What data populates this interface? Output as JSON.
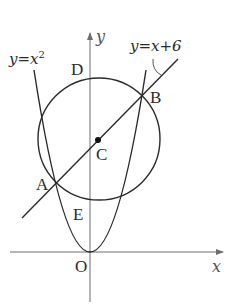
{
  "diagram": {
    "type": "coordinate-geometry",
    "axes": {
      "x_label": "x",
      "y_label": "y",
      "origin_label": "O"
    },
    "curves": {
      "parabola": {
        "equation_label": "y=x",
        "exponent": "2"
      },
      "line": {
        "equation_label": "y=x+6"
      },
      "circle": {
        "center_label": "C"
      }
    },
    "points": {
      "A": "A",
      "B": "B",
      "C": "C",
      "D": "D",
      "E": "E"
    },
    "colors": {
      "stroke": "#2a2a2a",
      "axis": "#6e6e6e",
      "background": "#ffffff"
    }
  }
}
